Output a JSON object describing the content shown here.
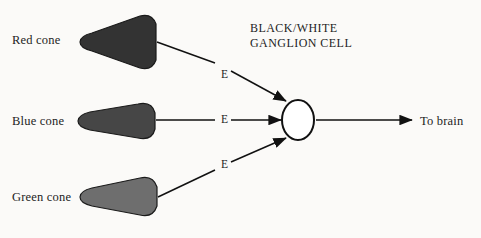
{
  "figure": {
    "background_color": "#fbfaf8",
    "ink_color": "#1d1d1d"
  },
  "cones": [
    {
      "label": "Red cone",
      "fill_color": "#333333",
      "stroke_color": "#1a1a1a",
      "label_x": 12,
      "label_y": 33,
      "shape_origin_x": 78,
      "shape_origin_y": 13
    },
    {
      "label": "Blue cone",
      "fill_color": "#464646",
      "stroke_color": "#1a1a1a",
      "label_x": 12,
      "label_y": 114,
      "shape_origin_x": 78,
      "shape_origin_y": 101
    },
    {
      "label": "Green cone",
      "fill_color": "#6e6e6e",
      "stroke_color": "#1a1a1a",
      "label_x": 12,
      "label_y": 190,
      "shape_origin_x": 80,
      "shape_origin_y": 177
    }
  ],
  "synapse_labels": [
    {
      "text": "E",
      "x": 221,
      "y": 68
    },
    {
      "text": "E",
      "x": 221,
      "y": 113
    },
    {
      "text": "E",
      "x": 221,
      "y": 158
    }
  ],
  "ganglion_cell": {
    "title_line_1": "BLACK/WHITE",
    "title_line_2": "GANGLION CELL",
    "title_x": 250,
    "title_y": 22,
    "center_x": 298,
    "center_y": 120,
    "radius_x": 16,
    "radius_y": 20,
    "fill_color": "#ffffff",
    "stroke_color": "#111111"
  },
  "output": {
    "label": "To brain",
    "label_x": 420,
    "label_y": 114
  }
}
